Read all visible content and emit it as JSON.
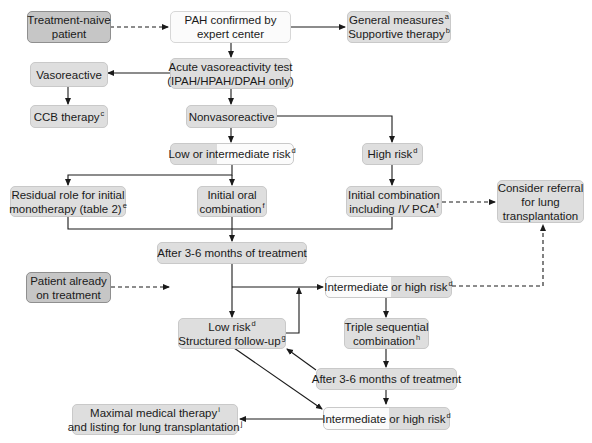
{
  "diagram": {
    "type": "flowchart",
    "topic": "PAH treatment algorithm",
    "colors": {
      "box_fill": "#dedede",
      "box_dark_fill": "#c6c6c6",
      "box_white_fill": "#fbfbfb",
      "line": "#1a1a1a"
    },
    "nodes": {
      "treatment_naive": {
        "line1": "Treatment-naive",
        "line2": "patient"
      },
      "pah_confirmed": {
        "line1": "PAH confirmed by",
        "line2": "expert center"
      },
      "general_measures": {
        "line1": "General measures",
        "sup1": "a",
        "line2": "Supportive therapy",
        "sup2": "b"
      },
      "vasoreactivity_test": {
        "line1": "Acute vasoreactivity test",
        "line2": "(IPAH/HPAH/DPAH only)"
      },
      "vasoreactive": {
        "label": "Vasoreactive"
      },
      "ccb_therapy": {
        "label": "CCB therapy",
        "sup": "c"
      },
      "nonvasoreactive": {
        "label": "Nonvasoreactive"
      },
      "low_intermediate_risk": {
        "label": "Low or intermediate risk",
        "sup": "d"
      },
      "high_risk": {
        "label": "High risk",
        "sup": "d"
      },
      "residual_role": {
        "line1": "Residual role for initial",
        "line2": "monotherapy (table 2)",
        "sup": "e"
      },
      "initial_oral": {
        "line1": "Initial oral",
        "line2": "combination",
        "sup": "f"
      },
      "initial_combination_iv": {
        "line1": "Initial combination",
        "line2_pre": "including ",
        "line2_italic": "IV",
        "line2_post": " PCA",
        "sup": "f"
      },
      "consider_referral": {
        "line1": "Consider referral",
        "line2": "for lung",
        "line3": "transplantation"
      },
      "after_months_1": {
        "label": "After 3-6 months of treatment"
      },
      "patient_already": {
        "line1": "Patient already",
        "line2": "on treatment"
      },
      "intermediate_high_risk_1": {
        "label": "Intermediate or high risk",
        "sup": "d"
      },
      "low_risk_followup": {
        "line1": "Low risk",
        "sup1": "d",
        "line2": "Structured follow-up",
        "sup2": "g"
      },
      "triple_sequential": {
        "line1": "Triple sequential",
        "line2": "combination",
        "sup": "h"
      },
      "after_months_2": {
        "label": "After 3-6 months of treatment"
      },
      "maximal_medical": {
        "line1": "Maximal medical therapy",
        "sup1": "i",
        "line2": "and listing for lung transplantation",
        "sup2": "j"
      },
      "intermediate_high_risk_2": {
        "label": "Intermediate or high risk",
        "sup": "d"
      }
    },
    "edges": [
      {
        "from": "treatment_naive",
        "to": "pah_confirmed",
        "style": "dashed"
      },
      {
        "from": "pah_confirmed",
        "to": "general_measures",
        "style": "solid"
      },
      {
        "from": "pah_confirmed",
        "to": "vasoreactivity_test",
        "style": "solid"
      },
      {
        "from": "vasoreactivity_test",
        "to": "vasoreactive",
        "style": "solid"
      },
      {
        "from": "vasoreactive",
        "to": "ccb_therapy",
        "style": "solid"
      },
      {
        "from": "vasoreactivity_test",
        "to": "nonvasoreactive",
        "style": "solid"
      },
      {
        "from": "nonvasoreactive",
        "to": "low_intermediate_risk",
        "style": "solid"
      },
      {
        "from": "nonvasoreactive",
        "to": "high_risk",
        "style": "solid"
      },
      {
        "from": "low_intermediate_risk",
        "to": "residual_role",
        "style": "solid"
      },
      {
        "from": "low_intermediate_risk",
        "to": "initial_oral",
        "style": "solid"
      },
      {
        "from": "high_risk",
        "to": "initial_combination_iv",
        "style": "solid"
      },
      {
        "from": "initial_combination_iv",
        "to": "consider_referral",
        "style": "dashed"
      },
      {
        "from": "residual_role",
        "to": "after_months_1",
        "style": "solid"
      },
      {
        "from": "initial_oral",
        "to": "after_months_1",
        "style": "solid"
      },
      {
        "from": "initial_combination_iv",
        "to": "after_months_1",
        "style": "solid"
      },
      {
        "from": "patient_already",
        "to": "after_months_1 branch",
        "style": "dashed"
      },
      {
        "from": "after_months_1",
        "to": "low_risk_followup",
        "style": "solid"
      },
      {
        "from": "after_months_1",
        "to": "intermediate_high_risk_1",
        "style": "solid"
      },
      {
        "from": "low_risk_followup",
        "to": "intermediate_high_risk_1",
        "style": "solid"
      },
      {
        "from": "intermediate_high_risk_1",
        "to": "consider_referral",
        "style": "dashed"
      },
      {
        "from": "intermediate_high_risk_1",
        "to": "triple_sequential",
        "style": "solid"
      },
      {
        "from": "triple_sequential",
        "to": "after_months_2",
        "style": "solid"
      },
      {
        "from": "after_months_2",
        "to": "low_risk_followup",
        "style": "solid"
      },
      {
        "from": "after_months_2",
        "to": "intermediate_high_risk_2",
        "style": "solid"
      },
      {
        "from": "low_risk_followup",
        "to": "intermediate_high_risk_2",
        "style": "solid"
      },
      {
        "from": "intermediate_high_risk_2",
        "to": "maximal_medical",
        "style": "solid"
      }
    ]
  }
}
